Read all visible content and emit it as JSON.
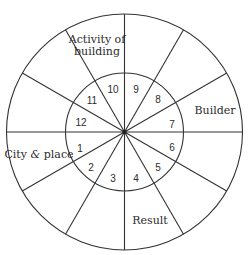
{
  "diagram": {
    "center": [
      124.5,
      132
    ],
    "outer_radius": 118,
    "inner_radius": 59,
    "spokes": 12,
    "line_color": "#333333",
    "sectors": [
      "1",
      "2",
      "3",
      "4",
      "5",
      "6",
      "7",
      "8",
      "9",
      "10",
      "11",
      "12"
    ],
    "labels": {
      "activity_line1": "Activity of",
      "activity_line2": "building",
      "builder": "Builder",
      "city": "City",
      "city_amp": "&",
      "city_place": "place",
      "result": "Result"
    }
  }
}
